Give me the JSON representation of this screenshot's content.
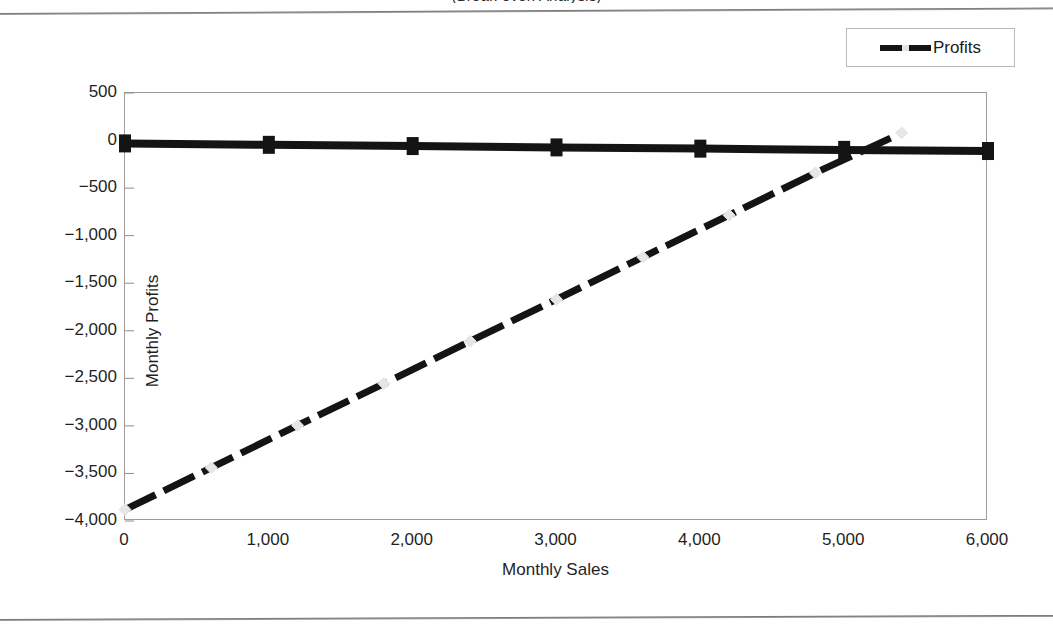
{
  "chart_data": {
    "type": "line",
    "title": "",
    "xlabel": "Monthly Sales",
    "ylabel": "Monthly Profits",
    "xlim": [
      0,
      6000
    ],
    "ylim": [
      -4000,
      500
    ],
    "xticks": [
      "0",
      "1,000",
      "2,000",
      "3,000",
      "4,000",
      "5,000",
      "6,000"
    ],
    "xtick_values": [
      0,
      1000,
      2000,
      3000,
      4000,
      5000,
      6000
    ],
    "yticks": [
      "500",
      "0",
      "−500",
      "−1,000",
      "−1,500",
      "−2,000",
      "−2,500",
      "−3,000",
      "−3,500",
      "−4,000"
    ],
    "ytick_values": [
      500,
      0,
      -500,
      -1000,
      -1500,
      -2000,
      -2500,
      -3000,
      -3500,
      -4000
    ],
    "grid": false,
    "legend_position": "top-right",
    "legend_entries": [
      "Profits"
    ],
    "series": [
      {
        "name": "Profits",
        "marker": "diamond",
        "marker_color": "#e6e6e6",
        "line_color": "#141414",
        "x": [
          0,
          600,
          1200,
          1800,
          2400,
          3000,
          3600,
          4200,
          4800,
          5400
        ],
        "values": [
          -3880,
          -3440,
          -2995,
          -2555,
          -2110,
          -1670,
          -1225,
          -785,
          -340,
          80
        ],
        "zero_crossing_x": 5110
      },
      {
        "name": "Breakeven baseline",
        "marker": "square",
        "marker_color": "#141414",
        "line_color": "#141414",
        "x": [
          0,
          1000,
          2000,
          3000,
          4000,
          5000,
          6000
        ],
        "values": [
          -30,
          -45,
          -58,
          -72,
          -85,
          -98,
          -110
        ]
      }
    ]
  },
  "legend": {
    "label": "Profits"
  },
  "axes": {
    "x_title": "Monthly Sales",
    "y_title": "Monthly Profits"
  },
  "title_fragment": "(Break-even Analysis)"
}
